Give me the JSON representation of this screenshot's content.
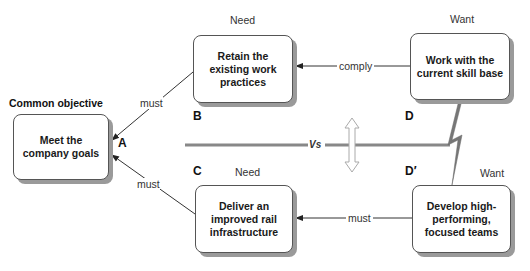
{
  "diagram": {
    "common_objective_label": "Common objective",
    "boxes": {
      "A": {
        "letter": "A",
        "text": "Meet the company goals"
      },
      "B": {
        "letter": "B",
        "heading": "Need",
        "text": "Retain the existing work practices"
      },
      "C": {
        "letter": "C",
        "heading": "Need",
        "text": "Deliver an improved rail infrastructure"
      },
      "D": {
        "letter": "D",
        "heading": "Want",
        "text": "Work with the current skill base"
      },
      "D_prime": {
        "letter": "D′",
        "heading": "Want",
        "text": "Develop high-performing, focused teams"
      }
    },
    "connectors": {
      "B_to_A": "must",
      "C_to_A": "must",
      "D_to_B": "comply",
      "Dp_to_C": "must"
    },
    "conflict_label": "Vs"
  }
}
